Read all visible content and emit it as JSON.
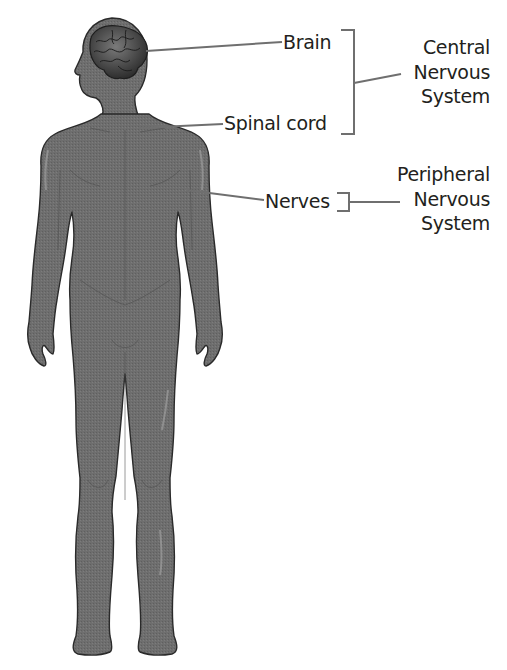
{
  "diagram": {
    "labels": {
      "brain": "Brain",
      "spinal_cord": "Spinal cord",
      "nerves": "Nerves"
    },
    "groups": {
      "central": {
        "line1": "Central",
        "line2": "Nervous",
        "line3": "System"
      },
      "peripheral": {
        "line1": "Peripheral",
        "line2": "Nervous",
        "line3": "System"
      }
    },
    "colors": {
      "body_fill": "#6d6d6d",
      "body_outline": "#2a2a2a",
      "brain_fill": "#4a4a4a",
      "leader_line": "#6f6f6f",
      "text": "#231f20"
    }
  }
}
